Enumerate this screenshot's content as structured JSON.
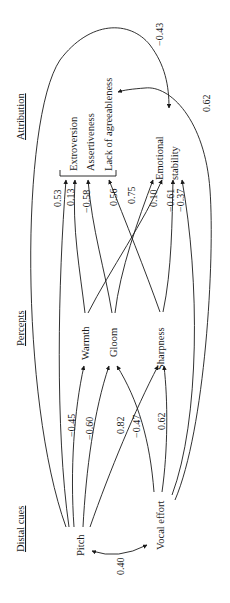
{
  "columns": {
    "distal_cues": "Distal cues",
    "percepts": "Percepts",
    "attribution": "Attribution"
  },
  "nodes": {
    "pitch": "Pitch",
    "vocal_effort": "Vocal effort",
    "warmth": "Warmth",
    "gloom": "Gloom",
    "sharpness": "Sharpness",
    "extroversion": "Extroversion",
    "assertiveness": "Assertiveness",
    "lack_of_agreeableness": "Lack of agreeableness",
    "emotional_stability_1": "Emotional",
    "emotional_stability_2": "stability"
  },
  "edges": {
    "pitch_vocal_effort": "0.40",
    "pitch_warmth": "−0.45",
    "pitch_gloom": "−0.60",
    "vocal_effort_gloom": "0.82",
    "pitch_sharpness": "−0.47",
    "vocal_effort_sharpness": "0.62",
    "pitch_extroversion": "0.53",
    "warmth_assertiveness": "0.13",
    "gloom_assertiveness": "−0.58",
    "sharpness_lack_of_agreeableness": "0.56",
    "gloom_emotional_stability": "0.75",
    "warmth_emotional_stability": "0.10",
    "sharpness_emotional_stability": "−0.61",
    "vocal_effort_emotional_stability": "−0.37",
    "pitch_emotional_stability_direct": "−0.43",
    "vocal_effort_lack_of_agreeableness_direct": "0.62"
  }
}
